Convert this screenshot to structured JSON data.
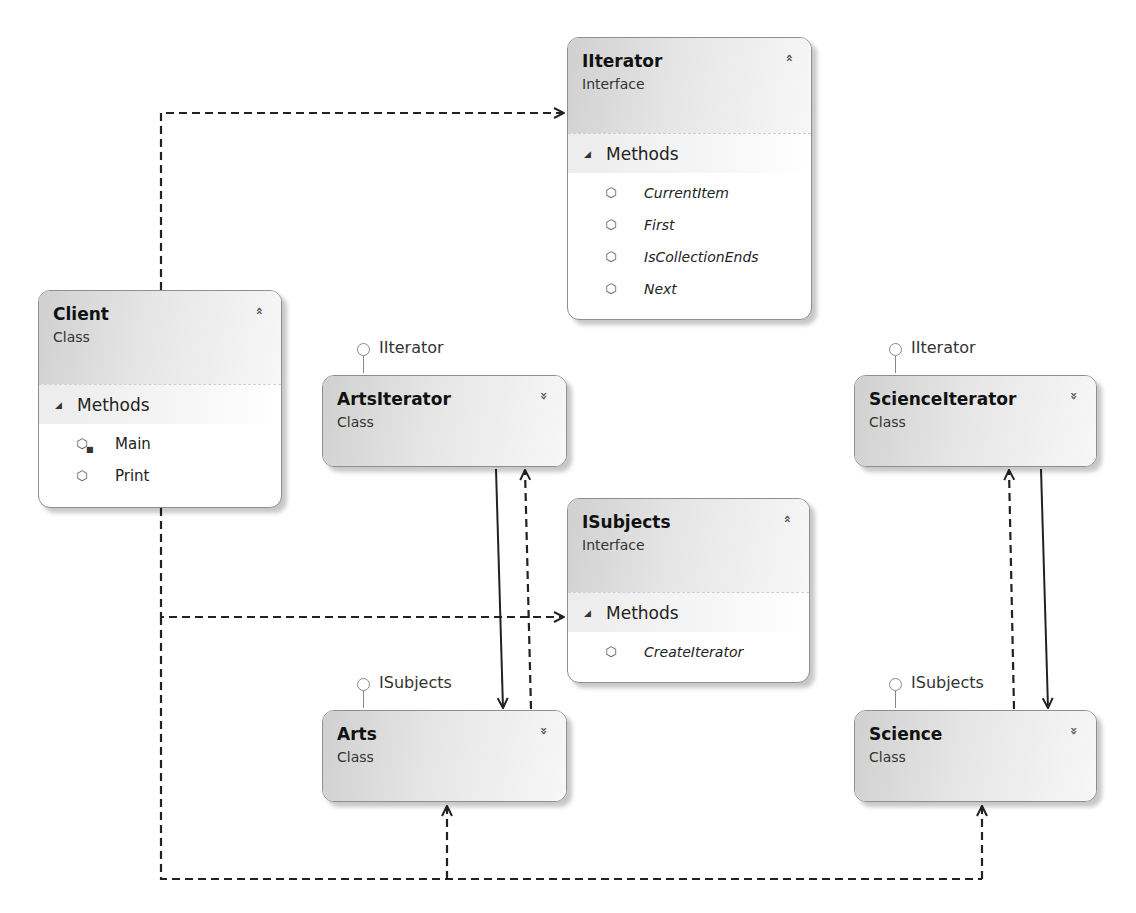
{
  "diagram": {
    "type": "class-diagram",
    "pattern": "Iterator"
  },
  "icons": {
    "expanded_toggle": "double-chevron-up",
    "collapsed_toggle": "double-chevron-down",
    "section_expander": "triangle-down",
    "method": "method-cube-icon",
    "private_method": "method-cube-lock-icon"
  },
  "glyphs": {
    "chevron_up": "»",
    "chevron_down": "»",
    "triangle": "◢",
    "cube": "⬡",
    "lock": "■"
  },
  "client": {
    "name": "Client",
    "kind": "Class",
    "section": "Methods",
    "methods": [
      {
        "name": "Main",
        "visibility": "private"
      },
      {
        "name": "Print",
        "visibility": "public"
      }
    ]
  },
  "iiterator": {
    "name": "IIterator",
    "kind": "Interface",
    "section": "Methods",
    "methods": [
      {
        "name": "CurrentItem"
      },
      {
        "name": "First"
      },
      {
        "name": "IsCollectionEnds"
      },
      {
        "name": "Next"
      }
    ]
  },
  "isubjects": {
    "name": "ISubjects",
    "kind": "Interface",
    "section": "Methods",
    "methods": [
      {
        "name": "CreateIterator"
      }
    ]
  },
  "artsiterator": {
    "name": "ArtsIterator",
    "kind": "Class",
    "implements": "IIterator"
  },
  "scienceiterator": {
    "name": "ScienceIterator",
    "kind": "Class",
    "implements": "IIterator"
  },
  "arts": {
    "name": "Arts",
    "kind": "Class",
    "implements": "ISubjects"
  },
  "science": {
    "name": "Science",
    "kind": "Class",
    "implements": "ISubjects"
  },
  "relationships": [
    {
      "from": "Client",
      "to": "IIterator",
      "style": "dashed",
      "kind": "dependency"
    },
    {
      "from": "Client",
      "to": "ISubjects",
      "style": "dashed",
      "kind": "dependency"
    },
    {
      "from": "Client",
      "to": "Arts",
      "style": "dashed",
      "kind": "dependency"
    },
    {
      "from": "Client",
      "to": "Science",
      "style": "dashed",
      "kind": "dependency"
    },
    {
      "from": "ArtsIterator",
      "to": "Arts",
      "style": "solid",
      "kind": "association"
    },
    {
      "from": "Arts",
      "to": "ArtsIterator",
      "style": "dashed",
      "kind": "dependency"
    },
    {
      "from": "ScienceIterator",
      "to": "Science",
      "style": "solid",
      "kind": "association"
    },
    {
      "from": "Science",
      "to": "ScienceIterator",
      "style": "dashed",
      "kind": "dependency"
    }
  ],
  "colors": {
    "line": "#222222",
    "box_border": "#8f8f8f",
    "header_gradient_start": "#d0d0d0",
    "header_gradient_end": "#f7f7f7"
  }
}
